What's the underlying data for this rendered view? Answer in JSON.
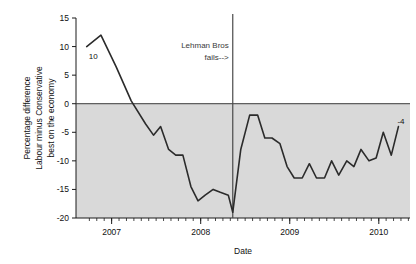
{
  "chart_data": {
    "type": "line",
    "title": "",
    "xlabel": "Date",
    "ylabel": "Percentage difference Labour minus Conservative best on the economy",
    "ylabel_lines": [
      "Percentage difference",
      "Labour minus Conservative",
      "best on the economy"
    ],
    "xlim": [
      2006.6,
      2010.35
    ],
    "ylim": [
      -20,
      15
    ],
    "yticks": [
      15,
      10,
      5,
      0,
      -5,
      -10,
      -15,
      -20
    ],
    "ytick_labels": [
      "15",
      "10",
      "5",
      "0",
      "-5",
      "-10",
      "-15",
      "-20"
    ],
    "xticks": [
      2007,
      2008,
      2009,
      2010
    ],
    "xtick_labels": [
      "2007",
      "2008",
      "2009",
      "2010"
    ],
    "minor_xtick_step": 0.0833,
    "grid": false,
    "legend": null,
    "zero_line": 0,
    "shaded_region": {
      "from": 0,
      "to": -20,
      "color": "#d9d9d9"
    },
    "line_color": "#2b2b2b",
    "line_width": 1.6,
    "series": [
      {
        "name": "Labour minus Conservative best on the economy",
        "x": [
          2006.72,
          2006.88,
          2007.05,
          2007.22,
          2007.38,
          2007.47,
          2007.55,
          2007.64,
          2007.72,
          2007.8,
          2007.89,
          2007.97,
          2008.05,
          2008.14,
          2008.22,
          2008.31,
          2008.36,
          2008.45,
          2008.55,
          2008.64,
          2008.72,
          2008.8,
          2008.89,
          2008.97,
          2009.05,
          2009.14,
          2009.22,
          2009.3,
          2009.39,
          2009.47,
          2009.55,
          2009.64,
          2009.72,
          2009.8,
          2009.89,
          2009.97,
          2010.05,
          2010.14,
          2010.22
        ],
        "y": [
          10,
          12,
          6.5,
          0.5,
          -3.5,
          -5.5,
          -4,
          -8,
          -9,
          -9,
          -14.5,
          -17,
          -16,
          -15,
          -15.5,
          -16,
          -19,
          -8,
          -2,
          -2,
          -6,
          -6,
          -7,
          -11,
          -13,
          -13,
          -10.5,
          -13,
          -13,
          -10,
          -12.5,
          -10,
          -11,
          -8,
          -10,
          -9.5,
          -5,
          -9,
          -4
        ]
      }
    ],
    "annotations": [
      {
        "name": "start-value-label",
        "text": "10",
        "x": 2006.72,
        "y": 10
      },
      {
        "name": "end-value-label",
        "text": "-4",
        "x": 2010.22,
        "y": -4
      },
      {
        "name": "lehman-note",
        "text_lines": [
          "Lehman Bros",
          "fails-->"
        ],
        "x": 2008.36
      }
    ],
    "vline": {
      "name": "lehman-vline",
      "x": 2008.36,
      "color": "#4a4a4a"
    }
  }
}
